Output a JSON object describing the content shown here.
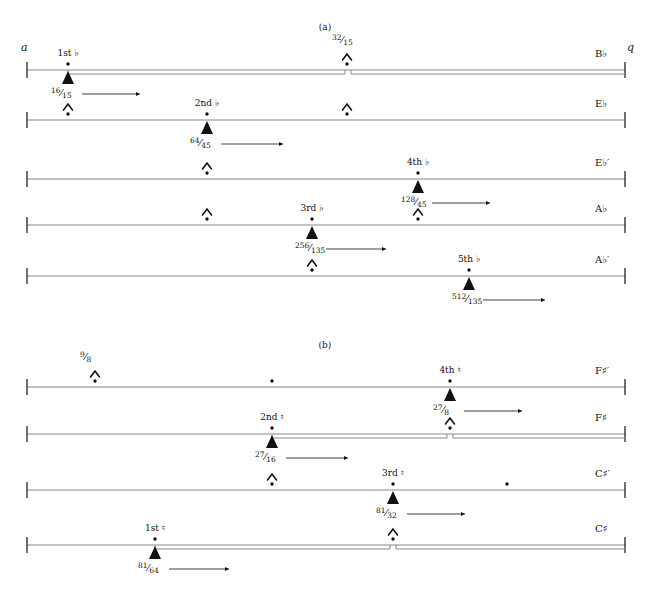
{
  "figure": {
    "width": 650,
    "height": 591,
    "line_color": "#888888",
    "ink_color": "#111111",
    "axis_start_label": "a",
    "axis_end_label": "q"
  },
  "panels": [
    {
      "caption": "(a)",
      "caption_x": 325,
      "caption_y": 22,
      "show_axis_endpoints": true,
      "rows": [
        {
          "name": "row-a-1",
          "end_label": "B♭",
          "y": 70,
          "double_line": true,
          "double_line_start_x": 68,
          "double_line_gap_x": 348,
          "markers": [
            {
              "kind": "triangle",
              "x": 68,
              "label_top": "1st ♭",
              "ratio_num": "16",
              "ratio_den": "15",
              "arrow": true,
              "arrow_len": 58
            },
            {
              "kind": "caret",
              "x": 347,
              "ratio_num": "32",
              "ratio_den": "15",
              "ratio_above": true
            }
          ]
        },
        {
          "name": "row-a-2",
          "end_label": "E♭",
          "y": 120,
          "double_line": false,
          "markers": [
            {
              "kind": "caret",
              "x": 68
            },
            {
              "kind": "triangle",
              "x": 207,
              "label_top": "2nd ♭",
              "ratio_num": "64",
              "ratio_den": "45",
              "arrow": true,
              "arrow_len": 62
            },
            {
              "kind": "caret",
              "x": 347
            }
          ]
        },
        {
          "name": "row-a-3",
          "end_label": "E♭′",
          "y": 179,
          "double_line": false,
          "markers": [
            {
              "kind": "caret",
              "x": 207
            },
            {
              "kind": "triangle",
              "x": 418,
              "label_top": "4th ♭",
              "ratio_num": "128",
              "ratio_den": "45",
              "arrow": true,
              "arrow_len": 58
            }
          ]
        },
        {
          "name": "row-a-4",
          "end_label": "A♭",
          "y": 225,
          "double_line": false,
          "markers": [
            {
              "kind": "caret",
              "x": 207
            },
            {
              "kind": "triangle",
              "x": 312,
              "label_top": "3rd ♭",
              "ratio_num": "256",
              "ratio_den": "135",
              "arrow": true,
              "arrow_len": 60
            },
            {
              "kind": "caret",
              "x": 418
            }
          ]
        },
        {
          "name": "row-a-5",
          "end_label": "A♭′",
          "y": 276,
          "double_line": false,
          "markers": [
            {
              "kind": "caret",
              "x": 312
            },
            {
              "kind": "triangle",
              "x": 469,
              "label_top": "5th ♭",
              "ratio_num": "512",
              "ratio_den": "135",
              "arrow": true,
              "arrow_len": 62
            }
          ]
        }
      ]
    },
    {
      "caption": "(b)",
      "caption_x": 325,
      "caption_y": 340,
      "show_axis_endpoints": false,
      "rows": [
        {
          "name": "row-b-1",
          "end_label": "F♯′",
          "y": 387,
          "double_line": false,
          "markers": [
            {
              "kind": "caret",
              "x": 95,
              "ratio_num": "9",
              "ratio_den": "8",
              "ratio_above": true
            },
            {
              "kind": "dot",
              "x": 272
            },
            {
              "kind": "triangle",
              "x": 450,
              "label_top": "4th ♮",
              "ratio_num": "27",
              "ratio_den": "8",
              "arrow": true,
              "arrow_len": 58
            }
          ]
        },
        {
          "name": "row-b-2",
          "end_label": "F♯",
          "y": 434,
          "double_line": true,
          "double_line_start_x": 272,
          "double_line_gap_x": 450,
          "markers": [
            {
              "kind": "triangle",
              "x": 272,
              "label_top": "2nd ♮",
              "ratio_num": "27",
              "ratio_den": "16",
              "arrow": true,
              "arrow_len": 62
            },
            {
              "kind": "caret",
              "x": 450
            }
          ]
        },
        {
          "name": "row-b-3",
          "end_label": "C♯′",
          "y": 490,
          "double_line": false,
          "markers": [
            {
              "kind": "caret",
              "x": 272
            },
            {
              "kind": "triangle",
              "x": 393,
              "label_top": "3rd ♮",
              "ratio_num": "81",
              "ratio_den": "32",
              "arrow": true,
              "arrow_len": 58
            },
            {
              "kind": "dot",
              "x": 507
            }
          ]
        },
        {
          "name": "row-b-4",
          "end_label": "C♯",
          "y": 545,
          "double_line": true,
          "double_line_start_x": 155,
          "double_line_gap_x": 393,
          "markers": [
            {
              "kind": "triangle",
              "x": 155,
              "label_top": "1st ♮",
              "ratio_num": "81",
              "ratio_den": "64",
              "arrow": true,
              "arrow_len": 60
            },
            {
              "kind": "caret",
              "x": 393
            }
          ]
        }
      ]
    }
  ],
  "geometry": {
    "line_left_x": 27,
    "line_right_x": 625,
    "endpoint_tick_height": 16
  }
}
